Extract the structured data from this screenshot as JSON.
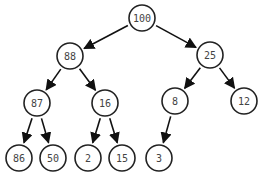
{
  "diagram": {
    "type": "binary-tree (max-heap)",
    "nodes": [
      {
        "id": "n100",
        "label": "100",
        "x": 142,
        "y": 18
      },
      {
        "id": "n88",
        "label": "88",
        "x": 70,
        "y": 56
      },
      {
        "id": "n25",
        "label": "25",
        "x": 210,
        "y": 55
      },
      {
        "id": "n87",
        "label": "87",
        "x": 37,
        "y": 103
      },
      {
        "id": "n16",
        "label": "16",
        "x": 105,
        "y": 103
      },
      {
        "id": "n8",
        "label": "8",
        "x": 175,
        "y": 101
      },
      {
        "id": "n12",
        "label": "12",
        "x": 244,
        "y": 101
      },
      {
        "id": "n86",
        "label": "86",
        "x": 19,
        "y": 158
      },
      {
        "id": "n50",
        "label": "50",
        "x": 53,
        "y": 158
      },
      {
        "id": "n2",
        "label": "2",
        "x": 88,
        "y": 158
      },
      {
        "id": "n15",
        "label": "15",
        "x": 122,
        "y": 158
      },
      {
        "id": "n3",
        "label": "3",
        "x": 159,
        "y": 158
      }
    ],
    "edges": [
      [
        "n100",
        "n88"
      ],
      [
        "n100",
        "n25"
      ],
      [
        "n88",
        "n87"
      ],
      [
        "n88",
        "n16"
      ],
      [
        "n25",
        "n8"
      ],
      [
        "n25",
        "n12"
      ],
      [
        "n87",
        "n86"
      ],
      [
        "n87",
        "n50"
      ],
      [
        "n16",
        "n2"
      ],
      [
        "n16",
        "n15"
      ],
      [
        "n8",
        "n3"
      ]
    ],
    "node_radius": 13,
    "colors": {
      "stroke": "#222222",
      "text": "#444444",
      "fill": "#ffffff"
    }
  }
}
